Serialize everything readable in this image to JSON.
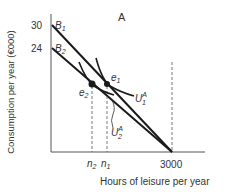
{
  "diagram": {
    "panel_label": "A",
    "y_axis_label": "Consumption per year (€000)",
    "x_axis_label": "Hours of leisure per year",
    "y_ticks": [
      {
        "value": "30",
        "budget": "B",
        "budget_sub": "1"
      },
      {
        "value": "24",
        "budget": "B",
        "budget_sub": "2"
      }
    ],
    "x_ticks": {
      "n2": {
        "base": "n",
        "sub": "2"
      },
      "n1": {
        "base": "n",
        "sub": "1"
      },
      "max": "3000"
    },
    "points": {
      "e1": {
        "base": "e",
        "sub": "1"
      },
      "e2": {
        "base": "e",
        "sub": "2"
      }
    },
    "curves": {
      "U1": {
        "base": "U",
        "sup": "A",
        "sub": "1"
      },
      "U2": {
        "base": "U",
        "sup": "A",
        "sub": "2"
      }
    },
    "colors": {
      "line": "#1a1a1a",
      "text": "#333333",
      "dashed": "#555555"
    }
  }
}
